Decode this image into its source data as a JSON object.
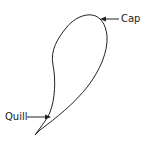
{
  "diagram": {
    "labels": {
      "cap": "Cap",
      "quill": "Quill"
    },
    "stroke_color": "#222222",
    "background": "#ffffff"
  }
}
